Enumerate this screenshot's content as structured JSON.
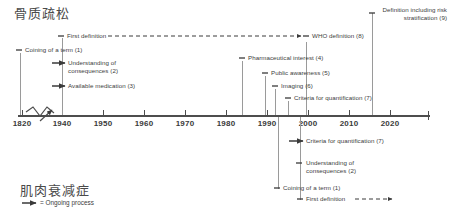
{
  "diagram": {
    "type": "dual-timeline",
    "top_section": {
      "title": "骨质疏松",
      "title_meaning": "osteoporosis",
      "events": [
        {
          "label": "First definition",
          "year": 1940,
          "x": 62,
          "y": 36,
          "marker": "tick",
          "trailing": "dashed-arrow"
        },
        {
          "label": "Coining of a term (1)",
          "year": 1820,
          "x": 20,
          "y": 50,
          "marker": "tick"
        },
        {
          "label": "Understanding of consequences (2)",
          "year": 1940,
          "x": 62,
          "y": 63,
          "marker": "arrow"
        },
        {
          "label": "Available medication (3)",
          "year": 1940,
          "x": 62,
          "y": 86,
          "marker": "arrow"
        },
        {
          "label": "Pharmaceutical interest (4)",
          "year": 1983,
          "x": 242,
          "y": 58,
          "marker": "tick"
        },
        {
          "label": "Public awareness (5)",
          "year": 1990,
          "x": 265,
          "y": 73,
          "marker": "tick"
        },
        {
          "label": "Imaging (6)",
          "year": 1993,
          "x": 275,
          "y": 86,
          "marker": "tick"
        },
        {
          "label": "Criteria for quantification (7)",
          "year": 1997,
          "x": 288,
          "y": 98,
          "marker": "tick"
        },
        {
          "label": "WHO definition (8)",
          "year": 1999,
          "x": 306,
          "y": 39,
          "marker": "tick"
        },
        {
          "label": "Definition including risk stratification (9)",
          "year": 2009,
          "x": 372,
          "y": 10,
          "marker": "tick"
        }
      ]
    },
    "bottom_section": {
      "title": "肌肉衰减症",
      "title_meaning": "sarcopenia",
      "events": [
        {
          "label": "Criteria for quantification (7)",
          "year": 1998,
          "x": 300,
          "y": 141,
          "marker": "arrow"
        },
        {
          "label": "Understanding of consequences (2)",
          "year": 1998,
          "x": 300,
          "y": 163,
          "marker": "tick"
        },
        {
          "label": "Coining of a term (1)",
          "year": 1989,
          "x": 278,
          "y": 188,
          "marker": "tick"
        },
        {
          "label": "First definition",
          "year": 1998,
          "x": 300,
          "y": 199,
          "marker": "tick",
          "trailing": "dashed-arrow"
        }
      ]
    },
    "axis": {
      "start_year": 1820,
      "end_year": 2020,
      "has_break": true,
      "break_between": [
        1820,
        1940
      ],
      "ticks": [
        {
          "label": "1820",
          "x": 22
        },
        {
          "label": "1940",
          "x": 62
        },
        {
          "label": "1950",
          "x": 103
        },
        {
          "label": "1960",
          "x": 144
        },
        {
          "label": "1970",
          "x": 185
        },
        {
          "label": "1980",
          "x": 226
        },
        {
          "label": "1990",
          "x": 267
        },
        {
          "label": "2000",
          "x": 308
        },
        {
          "label": "2010",
          "x": 349
        },
        {
          "label": "2020",
          "x": 390
        }
      ]
    },
    "legend": {
      "symbol": "arrow-right",
      "text": "= Ongoing process"
    }
  }
}
